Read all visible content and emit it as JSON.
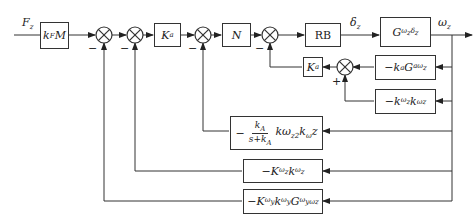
{
  "diagram": {
    "type": "control-block-diagram",
    "input_signal": "F_z",
    "output_signal": "ω_z",
    "intermediate_signal": "δ_z",
    "main_path_blocks": [
      {
        "id": "kfm",
        "label": "k_F M"
      },
      {
        "id": "ka1",
        "label": "K_a"
      },
      {
        "id": "n",
        "label": "N"
      },
      {
        "id": "rb",
        "label": "RB"
      },
      {
        "id": "plant",
        "label": "G_{ωz δz}"
      }
    ],
    "feedback_blocks": [
      {
        "id": "fb_ka_g",
        "label": "−k_a G_{aωz}"
      },
      {
        "id": "fb_kwz",
        "label": "−k_{ωz} k_{ωz}"
      },
      {
        "id": "fb_ka2",
        "label": "K_a"
      },
      {
        "id": "fb_filter",
        "label": "−k_A/(s+k_A) · kω_{z2} k_ω z",
        "num": "k_A",
        "den": "s+k_A",
        "suffix": "kω_z2 k_ω z"
      },
      {
        "id": "fb_Kwz",
        "label": "−K_{ωz} k_{ωz}"
      },
      {
        "id": "fb_Kwy",
        "label": "−K_{ωy} k_{ωy} G^{ωy}_{ωz}"
      }
    ],
    "summing_junctions": [
      {
        "id": "sum1",
        "sign": "−"
      },
      {
        "id": "sum2",
        "sign": "−"
      },
      {
        "id": "sum3",
        "sign": "−"
      },
      {
        "id": "sum4",
        "sign": "−"
      },
      {
        "id": "sum5",
        "sign": "+"
      }
    ]
  }
}
